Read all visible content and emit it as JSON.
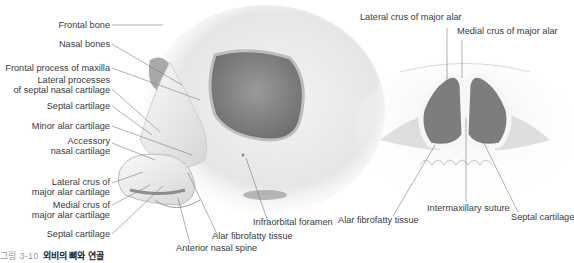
{
  "figure": {
    "caption": {
      "number": "그림 3-10",
      "title": "외비의 뼈와 연골"
    },
    "left_panel": {
      "view": "lateral-oblique view of nose and skull",
      "labels": [
        {
          "id": "frontal_bone",
          "text": "Frontal bone"
        },
        {
          "id": "nasal_bones",
          "text": "Nasal bones"
        },
        {
          "id": "frontal_process",
          "text": "Frontal process of maxilla"
        },
        {
          "id": "lateral_processes_1",
          "text": "Lateral processes"
        },
        {
          "id": "lateral_processes_2",
          "text": "of septal nasal cartilage"
        },
        {
          "id": "septal_cartilage_a",
          "text": "Septal cartilage"
        },
        {
          "id": "minor_alar",
          "text": "Minor alar cartilage"
        },
        {
          "id": "accessory_1",
          "text": "Accessory"
        },
        {
          "id": "accessory_2",
          "text": "nasal cartilage"
        },
        {
          "id": "lateral_crus_1",
          "text": "Lateral crus of"
        },
        {
          "id": "lateral_crus_2",
          "text": "major alar cartilage"
        },
        {
          "id": "medial_crus_1",
          "text": "Medial crus of"
        },
        {
          "id": "medial_crus_2",
          "text": "major alar cartilage"
        },
        {
          "id": "septal_cartilage_b",
          "text": "Septal cartilage"
        },
        {
          "id": "anterior_nasal_spine",
          "text": "Anterior nasal spine"
        },
        {
          "id": "alar_fibrofatty_left",
          "text": "Alar fibrofatty tissue"
        },
        {
          "id": "infraorbital_foramen",
          "text": "Infraorbital foramen"
        }
      ]
    },
    "right_panel": {
      "view": "inferior (basal) view of nose",
      "labels": [
        {
          "id": "lateral_crus_major",
          "text": "Lateral crus of major alar"
        },
        {
          "id": "medial_crus_major",
          "text": "Medial crus of major alar"
        },
        {
          "id": "alar_fibrofatty_right",
          "text": "Alar fibrofatty tissue"
        },
        {
          "id": "intermaxillary_suture",
          "text": "Intermaxillary suture"
        },
        {
          "id": "septal_cartilage_right",
          "text": "Septal cartilage"
        }
      ]
    }
  }
}
